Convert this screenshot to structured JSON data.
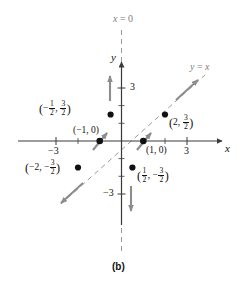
{
  "figure": {
    "caption": "(b)",
    "axes": {
      "x_axis_label": "x",
      "y_axis_label": "y",
      "x_ticks": [
        {
          "value": -3,
          "label": "−3"
        },
        {
          "value": 3,
          "label": "3"
        }
      ],
      "y_ticks": [
        {
          "value": 3,
          "label": "3"
        },
        {
          "value": -3,
          "label": "−3"
        }
      ],
      "x_range": [
        -4.2,
        4.2
      ],
      "y_range": [
        -4.4,
        4.4
      ]
    },
    "lines": [
      {
        "name": "x-equals-zero-line",
        "label": "x = 0",
        "label_parts": {
          "lhs": "x",
          "eq": "=",
          "rhs": "0"
        },
        "style": "dashed",
        "color": "#9a9a9a",
        "orientation": "vertical"
      },
      {
        "name": "y-equals-x-line",
        "label": "y = x",
        "label_parts": {
          "lhs": "y",
          "eq": "=",
          "rhs": "x"
        },
        "style": "dashed",
        "color": "#9a9a9a",
        "orientation": "diagonal",
        "slope": 1
      }
    ],
    "points": [
      {
        "name": "point-neg-half-three-halves",
        "label": "(−1/2, 3/2)",
        "x": -0.5,
        "y": 1.5,
        "label_position": "left"
      },
      {
        "name": "point-two-three-halves",
        "label": "(2, 3/2)",
        "x": 2,
        "y": 1.5,
        "label_position": "right"
      },
      {
        "name": "point-neg-one-zero",
        "label": "(−1, 0)",
        "x": -1,
        "y": 0,
        "label_position": "above"
      },
      {
        "name": "point-one-zero",
        "label": "(1, 0)",
        "x": 1,
        "y": 0,
        "label_position": "below-right"
      },
      {
        "name": "point-neg-two-neg-three-halves",
        "label": "(−2, −3/2)",
        "x": -2,
        "y": -1.5,
        "label_position": "left"
      },
      {
        "name": "point-half-neg-three-halves",
        "label": "(1/2, −3/2)",
        "x": 0.5,
        "y": -1.5,
        "label_position": "right"
      }
    ],
    "vectors": [
      {
        "name": "arrow-up-y-axis",
        "direction": "up",
        "near": "y-axis-positive"
      },
      {
        "name": "arrow-down-y-axis",
        "direction": "down",
        "near": "y-axis-negative"
      },
      {
        "name": "arrow-up-right-diagonal",
        "direction": "up-right",
        "near": "y-equals-x-upper"
      },
      {
        "name": "arrow-down-left-diagonal",
        "direction": "down-left",
        "near": "y-equals-x-lower"
      },
      {
        "name": "arrow-diagonal-at-neg-one-zero",
        "direction": "up-right",
        "near": "point-neg-one-zero"
      },
      {
        "name": "arrow-diagonal-at-one-zero",
        "direction": "up-right",
        "near": "point-one-zero"
      }
    ],
    "colors": {
      "axis": "#3a3a3a",
      "dashed_line": "#9a9a9a",
      "arrow": "#8d8d8d",
      "point": "#111111",
      "text": "#111111"
    }
  }
}
